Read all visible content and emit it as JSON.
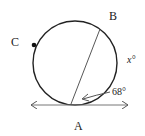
{
  "diagram": {
    "type": "circle-tangent-chord",
    "labels": {
      "point_a": "A",
      "point_b": "B",
      "point_c": "C",
      "arc_x": "x°",
      "angle": "68°"
    },
    "colors": {
      "stroke": "#222222",
      "background": "#ffffff"
    }
  }
}
